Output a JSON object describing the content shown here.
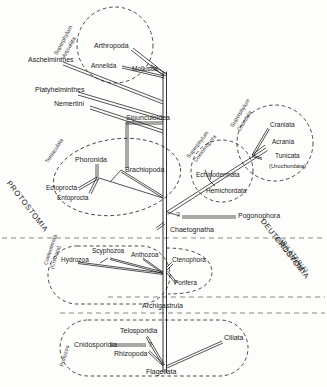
{
  "figure": {
    "type": "phylogenetic-tree-diagram",
    "background_color": "#fdfdfb",
    "line_color": "#1b1b1b"
  },
  "superphyla": [
    {
      "id": "articulata",
      "label_line1": "Superphylum",
      "label_line2": "Articulata",
      "shape": "circle"
    },
    {
      "id": "chordata",
      "label_line1": "Superphylum",
      "label_line2": "Chordata",
      "shape": "circle"
    },
    {
      "id": "coelomopora",
      "label_line1": "Superphylum",
      "label_line2": "Coelomopora",
      "shape": "circle"
    }
  ],
  "group_ovals": [
    {
      "id": "tentaculata",
      "label": "Tentaculata"
    },
    {
      "id": "coelenterata",
      "label_line1": "Coelenterata",
      "label_line2": "(Cnidaria)"
    },
    {
      "id": "protozoa",
      "label": "Protozoa"
    }
  ],
  "region_labels": [
    {
      "id": "protostomia",
      "text": "PROTOSTOMIA"
    },
    {
      "id": "deuterostomia",
      "text": "DEUTEROSTOMIA"
    },
    {
      "id": "coelomata",
      "line1": "COELOMATA",
      "line2": "(BILATERIA)"
    }
  ],
  "taxa": [
    {
      "id": "arthropoda",
      "label": "Arthropoda"
    },
    {
      "id": "annelida",
      "label": "Annelida"
    },
    {
      "id": "mollusca",
      "label": "Mollusca"
    },
    {
      "id": "aschelminthes",
      "label": "Aschelminthes"
    },
    {
      "id": "platyhelminthes",
      "label": "Platyhelminthes"
    },
    {
      "id": "nemertini",
      "label": "Nemertini"
    },
    {
      "id": "sipunculoidea",
      "label": "Sipunculoidea"
    },
    {
      "id": "phoronida",
      "label": "Phoronida"
    },
    {
      "id": "brachiopoda",
      "label": "Brachiopoda"
    },
    {
      "id": "ectoprocta",
      "label": "Ectoprocta"
    },
    {
      "id": "entoprocta",
      "label": "Entoprocta"
    },
    {
      "id": "craniata",
      "label": "Craniata"
    },
    {
      "id": "acrania",
      "label": "Acrania"
    },
    {
      "id": "tunicata",
      "label": "Tunicata"
    },
    {
      "id": "urochordata",
      "label": "(Urochordata)"
    },
    {
      "id": "echinodermata",
      "label": "Echinodermata"
    },
    {
      "id": "hemichordata",
      "label": "Hemichordata"
    },
    {
      "id": "pogonophora",
      "label": "Pogonophora"
    },
    {
      "id": "chaetognatha",
      "label": "Chaetognatha"
    },
    {
      "id": "hydrozoa",
      "label": "Hydrozoa"
    },
    {
      "id": "scyphozoa",
      "label": "Scyphozoa"
    },
    {
      "id": "anthozoa",
      "label": "Anthozoa"
    },
    {
      "id": "ctenophora",
      "label": "Ctenophora"
    },
    {
      "id": "porifera",
      "label": "Porifera"
    },
    {
      "id": "archigastrula",
      "label": "Archigastrula"
    },
    {
      "id": "telosporidia",
      "label": "Telosporidia"
    },
    {
      "id": "cnidosporidia",
      "label": "Cnidosporidia"
    },
    {
      "id": "rhizopoda",
      "label": "Rhizopoda"
    },
    {
      "id": "flagellata",
      "label": "Flagellata"
    },
    {
      "id": "ciliata",
      "label": "Ciliata"
    }
  ],
  "uncertainty_marks": [
    {
      "id": "q-pogonophora",
      "text": "?"
    },
    {
      "id": "q-cnidosporidia",
      "text": "?"
    }
  ]
}
